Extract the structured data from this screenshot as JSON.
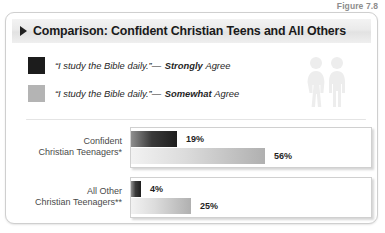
{
  "figure_caption": "Figure 7.8",
  "title": {
    "marker_icon": "triangle-right-icon",
    "text": "Comparison: Confident Christian Teens and All Others"
  },
  "legend": {
    "items": [
      {
        "swatch_color": "#1c1c1c",
        "swatch_style": "dark",
        "quote": "“I study the Bible daily.”",
        "dash": "—",
        "emphasis": "Strongly",
        "tail": "Agree"
      },
      {
        "swatch_color": "#b4b4b4",
        "swatch_style": "light",
        "quote": "“I study the Bible daily.”",
        "dash": "—",
        "emphasis": "Somewhat",
        "tail": "Agree"
      }
    ],
    "decoration": {
      "female_icon": "person-female-icon",
      "male_icon": "person-male-icon",
      "color": "#ededed"
    }
  },
  "chart_data": {
    "type": "bar",
    "orientation": "horizontal",
    "title": "Comparison: Confident Christian Teens and All Others",
    "xlabel": "",
    "ylabel": "",
    "xlim": [
      0,
      100
    ],
    "grid": false,
    "legend_position": "top",
    "categories": [
      "Confident Christian Teenagers*",
      "All Other Christian Teenagers**"
    ],
    "series": [
      {
        "name": "“I study the Bible daily.” — Strongly Agree",
        "color": "#1c1c1c",
        "values": [
          19,
          4
        ]
      },
      {
        "name": "“I study the Bible daily.” — Somewhat Agree",
        "color": "#b4b4b4",
        "values": [
          56,
          25
        ]
      }
    ],
    "groups": [
      {
        "label_line1": "Confident",
        "label_line2": "Christian Teenagers*",
        "bars": [
          {
            "style": "dark",
            "value": 19,
            "value_label": "19%"
          },
          {
            "style": "light",
            "value": 56,
            "value_label": "56%"
          }
        ]
      },
      {
        "label_line1": "All Other",
        "label_line2": "Christian Teenagers**",
        "bars": [
          {
            "style": "dark",
            "value": 4,
            "value_label": "4%"
          },
          {
            "style": "light",
            "value": 25,
            "value_label": "25%"
          }
        ]
      }
    ]
  }
}
